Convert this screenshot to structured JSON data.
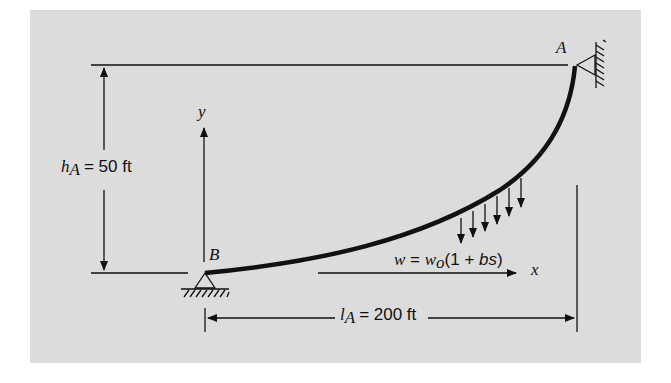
{
  "figure": {
    "background_color": "#dcdcdc",
    "line_color": "#111111",
    "points": {
      "A": {
        "label": "A"
      },
      "B": {
        "label": "B"
      }
    },
    "axes": {
      "x_label": "x",
      "y_label": "y"
    },
    "dimensions": {
      "height": {
        "symbol": "h",
        "subscript": "A",
        "value": "= 50 ft"
      },
      "length": {
        "symbol": "l",
        "subscript": "A",
        "value": "= 200 ft"
      }
    },
    "load": {
      "w": "w",
      "eq": " = ",
      "w0": "w",
      "w0_sub": "o",
      "expr_open": "(1 + ",
      "bs": "bs",
      "expr_close": ")"
    }
  }
}
